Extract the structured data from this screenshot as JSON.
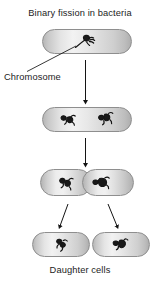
{
  "diagram": {
    "title": "Binary fission in bacteria",
    "labels": {
      "chromosome": "Chromosome",
      "daughter_cells": "Daughter cells"
    },
    "colors": {
      "background": "#ffffff",
      "text": "#1c1c1c",
      "cell_border": "#8e8e8e",
      "cell_fill_light": "#f2f2f2",
      "cell_fill_dark": "#aeaeae",
      "chromosome": "#1a1a1a",
      "arrow": "#1a1a1a"
    },
    "stages": [
      {
        "id": "stage-1",
        "name": "parent-cell",
        "chromosome_count": 1,
        "shape": "stadium"
      },
      {
        "id": "stage-2",
        "name": "chromosome-replicated",
        "chromosome_count": 2,
        "shape": "stadium"
      },
      {
        "id": "stage-3",
        "name": "cell-constricting",
        "chromosome_count": 2,
        "shape": "pinched-dumbbell"
      },
      {
        "id": "stage-4",
        "name": "daughter-cells",
        "chromosome_count": 2,
        "shape": "two-separate-stadiums"
      }
    ],
    "arrows": [
      {
        "id": "arrow-1-2",
        "direction": "down"
      },
      {
        "id": "arrow-2-3",
        "direction": "down"
      },
      {
        "id": "arrow-3-daughter-left",
        "direction": "down-left"
      },
      {
        "id": "arrow-3-daughter-right",
        "direction": "down-right"
      }
    ]
  }
}
